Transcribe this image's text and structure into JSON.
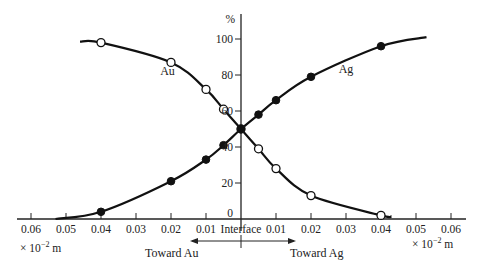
{
  "chart_data": {
    "type": "line",
    "title": "",
    "xlabel": "× 10⁻² m",
    "ylabel": "%",
    "x_unit_left": "× 10",
    "x_unit_exp": "−2",
    "x_unit_suffix": " m",
    "center_label": "Interface",
    "direction_left": "Toward Au",
    "direction_right": "Toward Ag",
    "x_ticks": [
      -0.06,
      -0.05,
      -0.04,
      -0.03,
      -0.02,
      -0.01,
      0,
      0.01,
      0.02,
      0.03,
      0.04,
      0.05,
      0.06
    ],
    "x_tick_labels_left": [
      "0.06",
      "0.05",
      "0.04",
      "0.03",
      "0.02",
      "0.01"
    ],
    "x_tick_labels_right": [
      "0.01",
      "0.02",
      "0.03",
      "0.04",
      "0.05",
      "0.06"
    ],
    "y_ticks": [
      0,
      20,
      40,
      60,
      80,
      100
    ],
    "y_tick_labels": [
      "0",
      "20",
      "40",
      "60",
      "80",
      "100"
    ],
    "xlim": [
      -0.06,
      0.06
    ],
    "ylim": [
      0,
      100
    ],
    "grid": false,
    "legend": "inline labels",
    "series": [
      {
        "name": "Au",
        "marker": "open-circle",
        "x": [
          -0.04,
          -0.02,
          -0.01,
          -0.005,
          0,
          0.005,
          0.01,
          0.02,
          0.04
        ],
        "values": [
          98,
          87,
          72,
          61,
          50,
          39,
          28,
          13,
          2
        ],
        "curve_extent": [
          [
            -0.046,
            98.5
          ],
          [
            0.043,
            1.5
          ]
        ],
        "label_pos": [
          -0.021,
          80
        ]
      },
      {
        "name": "Ag",
        "marker": "filled-circle",
        "x": [
          -0.04,
          -0.02,
          -0.01,
          -0.005,
          0,
          0.005,
          0.01,
          0.02,
          0.04
        ],
        "values": [
          4,
          21,
          33,
          41,
          50,
          58,
          66,
          79,
          96
        ],
        "curve_extent": [
          [
            -0.053,
            0
          ],
          [
            0.053,
            101
          ]
        ],
        "label_pos": [
          0.03,
          81
        ]
      }
    ]
  }
}
